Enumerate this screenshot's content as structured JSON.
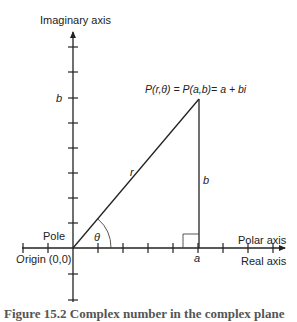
{
  "diagram": {
    "labels": {
      "imaginary_axis": "Imaginary axis",
      "polar_axis": "Polar axis",
      "real_axis": "Real axis",
      "pole": "Pole",
      "origin": "Origin (0,0)",
      "origin_O": "O",
      "origin_rest": "rigin (0,0)",
      "point": "P(r,θ) = P(a,b)= a + bi",
      "r": "r",
      "theta": "θ",
      "a": "a",
      "b_axis": "b",
      "b_side": "b"
    },
    "caption": "Figure 15.2  Complex number in the complex plane"
  }
}
